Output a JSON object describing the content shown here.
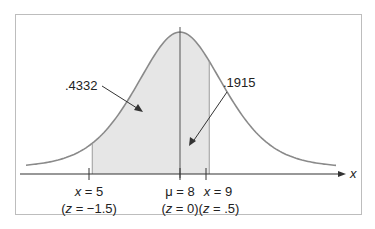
{
  "chart_data": {
    "type": "area",
    "title": "",
    "distribution": {
      "family": "normal",
      "mean": 8,
      "sd": 2
    },
    "xlabel": "x",
    "ylabel": "",
    "grid": false,
    "legend": null,
    "shaded_region": {
      "from": 5,
      "to": 9
    },
    "reference_points": [
      {
        "x": 5,
        "z": -1.5,
        "label": "x = 5",
        "z_label": "(z = −1.5)"
      },
      {
        "x": 8,
        "z": 0,
        "label": "μ = 8",
        "z_label": "(z = 0)"
      },
      {
        "x": 9,
        "z": 0.5,
        "label": "x = 9",
        "z_label": "(z = .5)"
      }
    ],
    "annotations": [
      {
        "text": ".4332",
        "region": "between x = 5 and μ = 8",
        "area": 0.4332
      },
      {
        "text": ".1915",
        "region": "between μ = 8 and x = 9",
        "area": 0.1915
      }
    ]
  },
  "labels": {
    "left_area": ".4332",
    "right_area": ".1915",
    "axis": "x",
    "x5_var": "x",
    "x5_eq": " = 5",
    "x5_z_open": "(",
    "x5_z_var": "z",
    "x5_z_rest": " = −1.5)",
    "mu_sym": "μ",
    "mu_eq": " = 8",
    "mu_z_open": "(",
    "mu_z_var": "z",
    "mu_z_rest": " = 0)",
    "x9_var": "x",
    "x9_eq": " = 9",
    "x9_z_open": "(",
    "x9_z_var": "z",
    "x9_z_rest": " = .5)"
  },
  "colors": {
    "curve": "#8a8a8a",
    "shade": "#e6e6e6",
    "axis": "#333333",
    "frame": "#bdbdbd"
  }
}
